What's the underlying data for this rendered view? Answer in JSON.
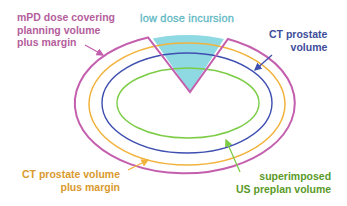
{
  "diagram": {
    "labels": {
      "mpd": [
        "mPD dose covering",
        "planning volume",
        "plus margin"
      ],
      "low_dose": "low dose incursion",
      "ct_prostate": [
        "CT prostate",
        "volume"
      ],
      "ct_margin": [
        "CT prostate volume",
        "plus margin"
      ],
      "us_preplan": [
        "superimposed",
        "US preplan volume"
      ]
    },
    "colors": {
      "mpd": "#c45fae",
      "ct_margin": "#f2b33d",
      "ct_prostate": "#3f4fb0",
      "us_preplan": "#7ccc45",
      "low_dose_fill": "#8fd9e3",
      "mpd_text": "#b45e9c",
      "low_dose_text": "#5fb9c4",
      "ct_text": "#3d4d9a",
      "ct_margin_text": "#d99a2e",
      "us_text": "#5a9a2a"
    },
    "contours": [
      {
        "name": "mpd-dose-contour",
        "cx": 187,
        "cy": 105,
        "rx": 110,
        "ry": 70
      },
      {
        "name": "ct-prostate-margin-contour",
        "cx": 187,
        "cy": 104,
        "rx": 98,
        "ry": 61
      },
      {
        "name": "ct-prostate-contour",
        "cx": 187,
        "cy": 103,
        "rx": 85,
        "ry": 50
      },
      {
        "name": "us-preplan-contour",
        "cx": 188,
        "cy": 103,
        "rx": 71,
        "ry": 35
      }
    ]
  }
}
